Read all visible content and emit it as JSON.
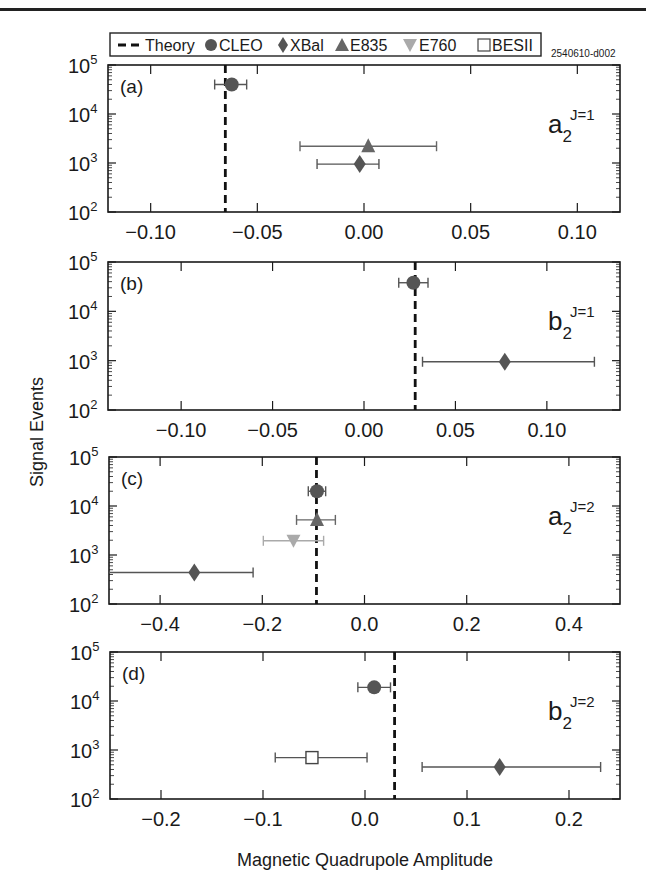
{
  "header": {
    "figure_id": "2540610-d002"
  },
  "legend": {
    "items": [
      {
        "key": "theory",
        "label": "Theory",
        "symbol": "dashed-line",
        "color": "#111111"
      },
      {
        "key": "cleo",
        "label": "CLEO",
        "symbol": "circle",
        "color": "#555555"
      },
      {
        "key": "xbal",
        "label": "XBal",
        "symbol": "diamond",
        "color": "#555555"
      },
      {
        "key": "e835",
        "label": "E835",
        "symbol": "triangle-up",
        "color": "#666666"
      },
      {
        "key": "e760",
        "label": "E760",
        "symbol": "triangle-down",
        "color": "#aaaaaa"
      },
      {
        "key": "besii",
        "label": "BESII",
        "symbol": "open-square",
        "color": "#444444"
      }
    ]
  },
  "axes": {
    "ylabel": "Signal Events",
    "xlabel": "Magnetic Quadrupole Amplitude",
    "ytick_labels": [
      {
        "base": "10",
        "exp": "5",
        "value": 100000
      },
      {
        "base": "10",
        "exp": "4",
        "value": 10000
      },
      {
        "base": "10",
        "exp": "3",
        "value": 1000
      },
      {
        "base": "10",
        "exp": "2",
        "value": 100
      }
    ]
  },
  "chart_data": [
    {
      "type": "scatter",
      "panel": "(a)",
      "title": "a2 J=1",
      "amplitude_label": {
        "main": "a",
        "sub": "2",
        "sup": "J=1"
      },
      "xlabel": "Magnetic Quadrupole Amplitude",
      "ylabel": "Signal Events",
      "yscale": "log",
      "xlim": [
        -0.12,
        0.12
      ],
      "ylim": [
        100,
        100000
      ],
      "xticks": [
        -0.1,
        -0.05,
        0.0,
        0.05,
        0.1
      ],
      "xtick_labels": [
        "−0.10",
        "−0.05",
        "0.00",
        "0.05",
        "0.10"
      ],
      "theory": -0.065,
      "points": [
        {
          "series": "CLEO",
          "x": -0.062,
          "xerr_low": -0.07,
          "xerr_high": -0.055,
          "y": 40000
        },
        {
          "series": "E835",
          "x": 0.002,
          "xerr_low": -0.03,
          "xerr_high": 0.034,
          "y": 2200
        },
        {
          "series": "XBal",
          "x": -0.002,
          "xerr_low": -0.022,
          "xerr_high": 0.007,
          "y": 950
        }
      ]
    },
    {
      "type": "scatter",
      "panel": "(b)",
      "title": "b2 J=1",
      "amplitude_label": {
        "main": "b",
        "sub": "2",
        "sup": "J=1"
      },
      "xlabel": "Magnetic Quadrupole Amplitude",
      "ylabel": "Signal Events",
      "yscale": "log",
      "xlim": [
        -0.14,
        0.14
      ],
      "ylim": [
        100,
        100000
      ],
      "xticks": [
        -0.1,
        -0.05,
        0.0,
        0.05,
        0.1
      ],
      "xtick_labels": [
        "−0.10",
        "−0.05",
        "0.00",
        "0.05",
        "0.10"
      ],
      "theory": 0.028,
      "points": [
        {
          "series": "CLEO",
          "x": 0.027,
          "xerr_low": 0.019,
          "xerr_high": 0.035,
          "y": 38000
        },
        {
          "series": "XBal",
          "x": 0.077,
          "xerr_low": 0.032,
          "xerr_high": 0.126,
          "y": 950
        }
      ]
    },
    {
      "type": "scatter",
      "panel": "(c)",
      "title": "a2 J=2",
      "amplitude_label": {
        "main": "a",
        "sub": "2",
        "sup": "J=2"
      },
      "xlabel": "Magnetic Quadrupole Amplitude",
      "ylabel": "Signal Events",
      "yscale": "log",
      "xlim": [
        -0.5,
        0.5
      ],
      "ylim": [
        100,
        100000
      ],
      "xticks": [
        -0.4,
        -0.2,
        0.0,
        0.2,
        0.4
      ],
      "xtick_labels": [
        "−0.4",
        "−0.2",
        "0.0",
        "0.2",
        "0.4"
      ],
      "theory": -0.094,
      "points": [
        {
          "series": "CLEO",
          "x": -0.093,
          "xerr_low": -0.11,
          "xerr_high": -0.076,
          "y": 20000
        },
        {
          "series": "E835",
          "x": -0.093,
          "xerr_low": -0.133,
          "xerr_high": -0.057,
          "y": 5200
        },
        {
          "series": "E760",
          "x": -0.139,
          "xerr_low": -0.198,
          "xerr_high": -0.08,
          "y": 1950
        },
        {
          "series": "XBal",
          "x": -0.333,
          "xerr_low": -0.5,
          "xerr_high": -0.218,
          "y": 440
        }
      ]
    },
    {
      "type": "scatter",
      "panel": "(d)",
      "title": "b2 J=2",
      "amplitude_label": {
        "main": "b",
        "sub": "2",
        "sup": "J=2"
      },
      "xlabel": "Magnetic Quadrupole Amplitude",
      "ylabel": "Signal Events",
      "yscale": "log",
      "xlim": [
        -0.25,
        0.25
      ],
      "ylim": [
        100,
        100000
      ],
      "xticks": [
        -0.2,
        -0.1,
        0.0,
        0.1,
        0.2
      ],
      "xtick_labels": [
        "−0.2",
        "−0.1",
        "0.0",
        "0.1",
        "0.2"
      ],
      "theory": 0.029,
      "points": [
        {
          "series": "CLEO",
          "x": 0.009,
          "xerr_low": -0.007,
          "xerr_high": 0.025,
          "y": 19000
        },
        {
          "series": "BESII",
          "x": -0.052,
          "xerr_low": -0.088,
          "xerr_high": 0.002,
          "y": 700
        },
        {
          "series": "XBal",
          "x": 0.132,
          "xerr_low": 0.056,
          "xerr_high": 0.231,
          "y": 450
        }
      ]
    }
  ]
}
